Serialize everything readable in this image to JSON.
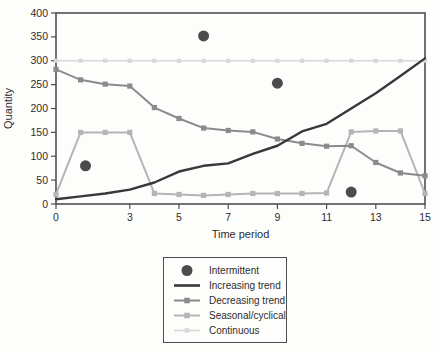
{
  "figure": {
    "background": "#fdfdfc",
    "text_color": "#2d2d2d",
    "axis_color": "#4f4f4f"
  },
  "chart_data": {
    "type": "line",
    "title": "",
    "xlabel": "Time period",
    "ylabel": "Quantity",
    "xlim": [
      0,
      15
    ],
    "ylim": [
      0,
      400
    ],
    "x_ticks": [
      0,
      3,
      5,
      7,
      9,
      11,
      13,
      15
    ],
    "y_ticks": [
      0,
      50,
      100,
      150,
      200,
      250,
      300,
      350,
      400
    ],
    "grid": false,
    "legend_position": "bottom-center-boxed",
    "x": [
      0,
      1,
      2,
      3,
      4,
      5,
      6,
      7,
      8,
      9,
      10,
      11,
      12,
      13,
      14,
      15
    ],
    "series": [
      {
        "name": "Intermittent",
        "type": "scatter",
        "marker": "circle",
        "color": "#4c4c4c",
        "points": [
          [
            1.2,
            80
          ],
          [
            6,
            352
          ],
          [
            9,
            253
          ],
          [
            12,
            25
          ]
        ]
      },
      {
        "name": "Increasing trend",
        "type": "line",
        "marker": "none",
        "color": "#383838",
        "values": [
          10,
          16,
          22,
          30,
          45,
          68,
          80,
          85,
          105,
          122,
          152,
          168,
          200,
          232,
          268,
          305
        ]
      },
      {
        "name": "Decreasing trend",
        "type": "line",
        "marker": "square",
        "color": "#8b8b8b",
        "values": [
          282,
          260,
          251,
          247,
          202,
          179,
          159,
          154,
          151,
          136,
          127,
          121,
          122,
          87,
          65,
          59
        ]
      },
      {
        "name": "Seasonal/cyclical",
        "type": "line",
        "marker": "square",
        "color": "#b5b5b5",
        "values": [
          20,
          150,
          150,
          150,
          22,
          20,
          18,
          20,
          22,
          22,
          22,
          23,
          151,
          153,
          153,
          22
        ]
      },
      {
        "name": "Continuous",
        "type": "line",
        "marker": "square",
        "color": "#d8d8d8",
        "values": [
          300,
          300,
          300,
          300,
          300,
          300,
          300,
          300,
          300,
          300,
          300,
          300,
          300,
          300,
          300,
          300
        ]
      }
    ]
  }
}
